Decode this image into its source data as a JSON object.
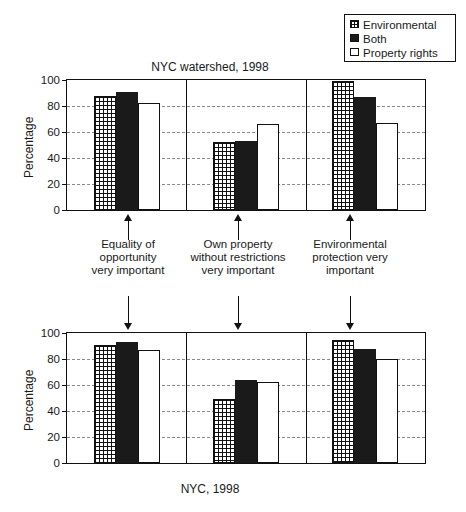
{
  "legend": {
    "items": [
      {
        "label": "Environmental",
        "swatch": "grid-swatch-icon",
        "color": "#111111"
      },
      {
        "label": "Both",
        "swatch": "solid-swatch-icon",
        "color": "#1a1a1a"
      },
      {
        "label": "Property rights",
        "swatch": "white-swatch-icon",
        "color": "#ffffff"
      }
    ]
  },
  "annotations": [
    {
      "line1": "Equality of",
      "line2": "opportunity",
      "line3": "very important"
    },
    {
      "line1": "Own property",
      "line2": "without restrictions",
      "line3": "very important"
    },
    {
      "line1": "Environmental",
      "line2": "protection very",
      "line3": "important"
    }
  ],
  "chart_data": [
    {
      "type": "bar",
      "title": "NYC watershed, 1998",
      "xlabel": "",
      "ylabel": "Percentage",
      "ylim": [
        0,
        100
      ],
      "yticks": [
        0,
        20,
        40,
        60,
        80,
        100
      ],
      "grid": true,
      "legend_position": "top-right",
      "categories": [
        "Equality of opportunity very important",
        "Own property without restrictions very important",
        "Environmental protection very important"
      ],
      "series": [
        {
          "name": "Environmental",
          "values": [
            88,
            52,
            99
          ]
        },
        {
          "name": "Both",
          "values": [
            91,
            53,
            87
          ]
        },
        {
          "name": "Property rights",
          "values": [
            82,
            66,
            67
          ]
        }
      ]
    },
    {
      "type": "bar",
      "title": "NYC, 1998",
      "xlabel": "",
      "ylabel": "Percentage",
      "ylim": [
        0,
        100
      ],
      "yticks": [
        0,
        20,
        40,
        60,
        80,
        100
      ],
      "grid": true,
      "legend_position": "none",
      "categories": [
        "Equality of opportunity very important",
        "Own property without restrictions very important",
        "Environmental protection very important"
      ],
      "series": [
        {
          "name": "Environmental",
          "values": [
            91,
            49,
            95
          ]
        },
        {
          "name": "Both",
          "values": [
            93,
            64,
            88
          ]
        },
        {
          "name": "Property rights",
          "values": [
            87,
            62,
            80
          ]
        }
      ]
    }
  ]
}
